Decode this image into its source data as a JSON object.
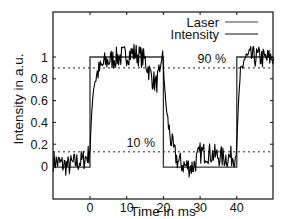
{
  "chart_data": {
    "type": "line",
    "title": "",
    "xlabel": "Time in ms",
    "ylabel": "Intensity in a.u.",
    "xlim": [
      -10,
      50
    ],
    "ylim": [
      -0.3,
      1.42
    ],
    "xticks": [
      0,
      10,
      20,
      30,
      40
    ],
    "xtick_labels": [
      "0",
      "10",
      "20",
      "30",
      "40"
    ],
    "yticks": [
      0,
      0.2,
      0.4,
      0.6,
      0.8,
      1
    ],
    "ytick_labels": [
      "0",
      "0.2",
      "0.4",
      "0.6",
      "0.8",
      "1"
    ],
    "grid": false,
    "legend": {
      "position": "upper right",
      "entries": [
        "Laser",
        "Intensity"
      ]
    },
    "reference_lines": [
      {
        "y": 0.9,
        "style": "dotted",
        "label": "90 %"
      },
      {
        "y": 0.13,
        "style": "dotted",
        "label": "10 %"
      }
    ],
    "series": [
      {
        "name": "Laser",
        "style": "step",
        "x": [
          -10,
          0,
          0,
          20,
          20,
          40,
          40,
          50
        ],
        "y": [
          -0.01,
          -0.01,
          1.0,
          1.0,
          -0.01,
          -0.01,
          1.0,
          1.0
        ]
      },
      {
        "name": "Intensity",
        "style": "noisy",
        "x": [
          -10,
          -8,
          -6,
          -4,
          -2,
          -0.5,
          0,
          0.5,
          1,
          2,
          3,
          4,
          6,
          8,
          10,
          12,
          13,
          14,
          15,
          16,
          17,
          18,
          19,
          19.8,
          20,
          20.5,
          21,
          22,
          23,
          24,
          26,
          28,
          29,
          30,
          32,
          34,
          36,
          38,
          39.8,
          40,
          40.5,
          41,
          42,
          44,
          46,
          48,
          50
        ],
        "y": [
          0.05,
          0.02,
          0.0,
          0.03,
          0.05,
          0.1,
          0.15,
          0.5,
          0.75,
          0.85,
          0.9,
          0.95,
          0.98,
          1.0,
          1.02,
          1.04,
          1.02,
          1.0,
          0.97,
          0.88,
          0.8,
          0.75,
          0.85,
          1.05,
          0.9,
          0.65,
          0.45,
          0.25,
          0.12,
          0.04,
          0.0,
          -0.01,
          0.05,
          0.12,
          0.12,
          0.1,
          0.08,
          0.08,
          0.1,
          0.2,
          0.6,
          0.85,
          0.98,
          1.0,
          1.0,
          0.98,
          1.0
        ],
        "noise_amplitude": 0.05
      }
    ]
  },
  "labels": {
    "xlabel": "Time in ms",
    "ylabel": "Intensity in a.u.",
    "legend_laser": "Laser",
    "legend_intensity": "Intensity",
    "annot_90": "90 %",
    "annot_10": "10 %"
  }
}
